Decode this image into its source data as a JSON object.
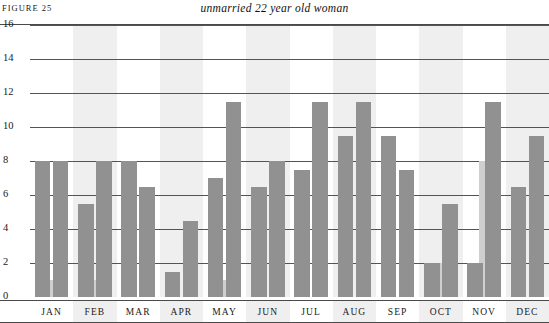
{
  "header": {
    "figure_label": "FIGURE 25",
    "title": "unmarried 22 year old woman"
  },
  "colors": {
    "bar_dark": "#919191",
    "bar_light": "#cfcfcf",
    "band_shaded": "#efefef",
    "band_plain": "#ffffff",
    "gridline": "#545454",
    "frame": "#4a4a4a"
  },
  "chart_data": {
    "type": "bar",
    "title": "unmarried 22 year old woman",
    "xlabel": "",
    "ylabel": "",
    "ylim": [
      0,
      16
    ],
    "ytick_labels": [
      "0",
      "2",
      "4",
      "6",
      "8",
      "10",
      "12",
      "14",
      "16"
    ],
    "ytick_values": [
      0,
      2,
      4,
      6,
      8,
      10,
      12,
      14,
      16
    ],
    "grid": true,
    "legend": "none",
    "categories": [
      "JAN",
      "FEB",
      "MAR",
      "APR",
      "MAY",
      "JUN",
      "JUL",
      "AUG",
      "SEP",
      "OCT",
      "NOV",
      "DEC"
    ],
    "series": [
      {
        "name": "left",
        "style": "dark",
        "values": [
          8,
          5.5,
          8,
          1.5,
          7,
          6.5,
          7.5,
          9.5,
          9.5,
          2,
          2,
          6.5
        ]
      },
      {
        "name": "right",
        "style": "dark",
        "values": [
          8,
          8,
          6.5,
          4.5,
          11.5,
          8,
          11.5,
          11.5,
          7.5,
          5.5,
          11.5,
          9.5
        ]
      },
      {
        "name": "inset-short",
        "style": "light",
        "values": [
          1,
          1,
          0,
          0,
          1,
          0,
          0,
          0,
          0,
          2,
          8,
          0
        ]
      }
    ]
  }
}
